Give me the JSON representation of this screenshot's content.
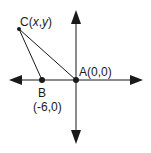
{
  "diagram": {
    "type": "coordinate-plane-triangle",
    "points": {
      "A": {
        "name": "A",
        "label": "A(0,0)",
        "coords": "(0,0)"
      },
      "B": {
        "name": "B",
        "label_name": "B",
        "label_coords": "(-6,0)"
      },
      "C": {
        "name": "C",
        "label_prefix": "C(",
        "label_x": "x",
        "label_comma": ",",
        "label_y": "y",
        "label_suffix": ")"
      }
    },
    "segments": [
      "AC",
      "BC",
      "AB"
    ],
    "axes": {
      "horizontal": "x-axis",
      "vertical": "y-axis",
      "arrows": "both-ends"
    },
    "colors": {
      "stroke": "#1a1a1a",
      "background": "#ffffff"
    }
  }
}
